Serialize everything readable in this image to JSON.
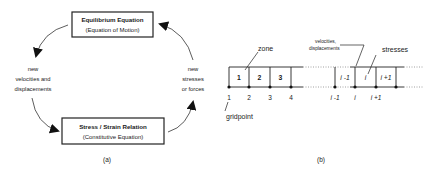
{
  "panel_a": {
    "caption": "(a)",
    "top_box": {
      "title": "Equilibrium Equation",
      "subtitle": "(Equation of Motion)"
    },
    "bottom_box": {
      "title": "Stress / Strain Relation",
      "subtitle": "(Constitutive Equation)"
    },
    "left_label": [
      "new",
      "velocities and",
      "displacements"
    ],
    "right_label": [
      "new",
      "stresses",
      "or forces"
    ]
  },
  "panel_b": {
    "caption": "(b)",
    "zone_label": "zone",
    "gridpoint_label": "gridpoint",
    "velocities_label": [
      "velocities,",
      "displacements"
    ],
    "stresses_label": "stresses",
    "left_zones": [
      "1",
      "2",
      "3"
    ],
    "left_gridpoints": [
      "1",
      "2",
      "3",
      "4"
    ],
    "right_zones": [
      "i -1",
      "i",
      "i +1"
    ],
    "right_gridpoints": [
      "i -1",
      "i",
      "i +1"
    ]
  }
}
